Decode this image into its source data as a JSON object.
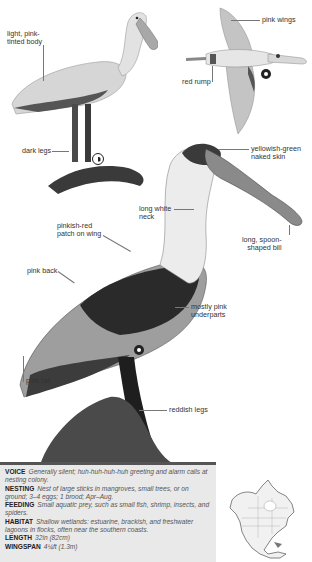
{
  "page": {
    "species": "Roseate Spoonbill"
  },
  "illustrations": {
    "standing_adult": {
      "labels": {
        "body": "light, pink-\ntinted body",
        "body_line1": "light, pink-",
        "body_line2": "tinted body",
        "legs": "dark legs"
      },
      "symbol": "juvenile-symbol"
    },
    "flight": {
      "labels": {
        "wings": "pink wings",
        "rump": "red rump"
      },
      "symbol": "adult-symbol"
    },
    "breeding_adult": {
      "labels": {
        "skin_line1": "yellowish-green",
        "skin_line2": "naked skin",
        "neck_line1": "long white",
        "neck_line2": "neck",
        "bill_line1": "long, spoon-",
        "bill_line2": "shaped bill",
        "patch_line1": "pinkish-red",
        "patch_line2": "patch on wing",
        "back": "pink back",
        "under_line1": "mostly pink",
        "under_line2": "underparts",
        "tail": "pink tail",
        "legs": "reddish legs"
      },
      "symbol": "adult-symbol"
    }
  },
  "info": {
    "voice": {
      "key": "VOICE",
      "value": "Generally silent; huh-huh-huh-huh greeting and alarm calls at nesting colony."
    },
    "nesting": {
      "key": "NESTING",
      "value": "Nest of large sticks in mangroves, small trees, or on ground; 3–4 eggs; 1 brood; Apr–Aug."
    },
    "feeding": {
      "key": "FEEDING",
      "value": "Small aquatic prey, such as small fish, shrimp, insects, and spiders."
    },
    "habitat": {
      "key": "HABITAT",
      "value": "Shallow wetlands: estuarine, brackish, and freshwater lagoons in flocks, often near the southern coasts."
    },
    "length": {
      "key": "LENGTH",
      "value": "32in (82cm)"
    },
    "wingspan": {
      "key": "WINGSPAN",
      "value": "4¼ft (1.3m)"
    }
  },
  "map": {
    "region": "North America range map"
  },
  "colors": {
    "info_bg": "#e9e9e9",
    "info_bar": "#555555",
    "ink": "#222222"
  }
}
